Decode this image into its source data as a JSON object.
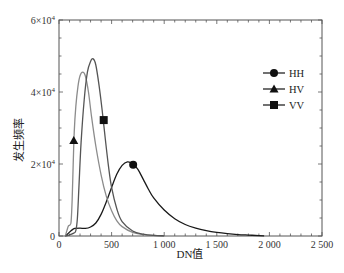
{
  "chart_data": {
    "type": "line",
    "title": "",
    "xlabel": "DN值",
    "ylabel": "发生频率",
    "xlim": [
      0,
      2500
    ],
    "ylim": [
      0,
      60000
    ],
    "grid": false,
    "legend_position": "upper right",
    "x_ticks": [
      {
        "value": 0,
        "label": "0"
      },
      {
        "value": 500,
        "label": "500"
      },
      {
        "value": 1000,
        "label": "1 000"
      },
      {
        "value": 1500,
        "label": "1 500"
      },
      {
        "value": 2000,
        "label": "2 000"
      },
      {
        "value": 2500,
        "label": "2 500"
      }
    ],
    "y_ticks": [
      {
        "value": 0,
        "label": "0",
        "sup": ""
      },
      {
        "value": 20000,
        "label": "2×10",
        "sup": "4"
      },
      {
        "value": 40000,
        "label": "4×10",
        "sup": "4"
      },
      {
        "value": 60000,
        "label": "6×10",
        "sup": "4"
      }
    ],
    "series": [
      {
        "name": "HH",
        "marker": "circle",
        "color": "#1a1a1a",
        "marker_point": [
          705,
          19800
        ],
        "points": [
          [
            60,
            0
          ],
          [
            90,
            800
          ],
          [
            120,
            1600
          ],
          [
            150,
            2100
          ],
          [
            200,
            2200
          ],
          [
            250,
            2100
          ],
          [
            300,
            2500
          ],
          [
            350,
            3600
          ],
          [
            400,
            6000
          ],
          [
            450,
            9500
          ],
          [
            500,
            13500
          ],
          [
            550,
            17200
          ],
          [
            600,
            19600
          ],
          [
            650,
            20600
          ],
          [
            700,
            20100
          ],
          [
            750,
            18500
          ],
          [
            800,
            15800
          ],
          [
            850,
            13000
          ],
          [
            900,
            10600
          ],
          [
            1000,
            7200
          ],
          [
            1100,
            4800
          ],
          [
            1200,
            3200
          ],
          [
            1300,
            2200
          ],
          [
            1400,
            1500
          ],
          [
            1500,
            1000
          ],
          [
            1600,
            650
          ],
          [
            1700,
            400
          ],
          [
            1800,
            250
          ],
          [
            1900,
            120
          ],
          [
            1950,
            60
          ]
        ]
      },
      {
        "name": "HV",
        "marker": "triangle",
        "color": "#8c8c8c",
        "marker_point": [
          140,
          26500
        ],
        "points": [
          [
            60,
            0
          ],
          [
            75,
            1500
          ],
          [
            90,
            2800
          ],
          [
            105,
            3100
          ],
          [
            115,
            4000
          ],
          [
            125,
            10000
          ],
          [
            135,
            20000
          ],
          [
            145,
            29000
          ],
          [
            160,
            36000
          ],
          [
            180,
            41500
          ],
          [
            200,
            44500
          ],
          [
            225,
            45500
          ],
          [
            250,
            44500
          ],
          [
            280,
            40000
          ],
          [
            310,
            33000
          ],
          [
            350,
            25000
          ],
          [
            400,
            17000
          ],
          [
            450,
            11000
          ],
          [
            500,
            7000
          ],
          [
            550,
            4200
          ],
          [
            600,
            2600
          ],
          [
            700,
            1000
          ],
          [
            800,
            400
          ],
          [
            900,
            150
          ],
          [
            1000,
            50
          ]
        ]
      },
      {
        "name": "VV",
        "marker": "square",
        "color": "#555555",
        "marker_point": [
          425,
          32200
        ],
        "points": [
          [
            60,
            0
          ],
          [
            100,
            300
          ],
          [
            140,
            800
          ],
          [
            160,
            1500
          ],
          [
            175,
            5000
          ],
          [
            190,
            14000
          ],
          [
            210,
            26000
          ],
          [
            240,
            38000
          ],
          [
            270,
            45500
          ],
          [
            300,
            48500
          ],
          [
            325,
            49200
          ],
          [
            350,
            47500
          ],
          [
            380,
            42000
          ],
          [
            410,
            35000
          ],
          [
            440,
            27000
          ],
          [
            470,
            19500
          ],
          [
            500,
            13500
          ],
          [
            550,
            7500
          ],
          [
            600,
            4000
          ],
          [
            700,
            1400
          ],
          [
            800,
            500
          ],
          [
            900,
            150
          ],
          [
            1000,
            50
          ]
        ]
      }
    ]
  },
  "legend": {
    "items": [
      {
        "label": "HH",
        "marker": "circle"
      },
      {
        "label": "HV",
        "marker": "triangle"
      },
      {
        "label": "VV",
        "marker": "square"
      }
    ]
  },
  "axes": {
    "xlabel": "DN值",
    "ylabel": "发生频率"
  }
}
